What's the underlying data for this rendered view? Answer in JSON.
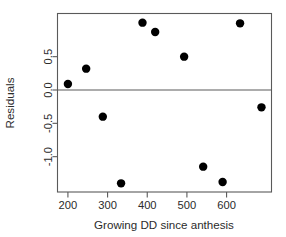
{
  "chart_data": {
    "type": "scatter",
    "title": "",
    "xlabel": "Growing DD since anthesis",
    "ylabel": "Residuals",
    "xlim": [
      175,
      712
    ],
    "ylim": [
      -1.53,
      1.14
    ],
    "grid": false,
    "legend": null,
    "xticks": [
      200,
      300,
      400,
      500,
      600
    ],
    "xtick_labels": [
      "200",
      "300",
      "400",
      "500",
      "600"
    ],
    "yticks": [
      0.5,
      0.0,
      -0.5,
      -1.0
    ],
    "ytick_labels": [
      "0.5",
      "0.0",
      "-0.5",
      "-1.0"
    ],
    "reference_lines": [
      {
        "orientation": "horizontal",
        "value": 0.0
      }
    ],
    "marker": {
      "shape": "circle",
      "color": "#000000",
      "size": 4.2
    },
    "x": [
      200,
      246,
      288,
      334,
      388,
      420,
      493,
      541,
      590,
      634,
      688
    ],
    "y": [
      0.09,
      0.32,
      -0.4,
      -1.4,
      1.01,
      0.87,
      0.5,
      -1.15,
      -1.38,
      1.0,
      -0.26
    ],
    "points": [
      {
        "x": 200,
        "y": 0.09
      },
      {
        "x": 246,
        "y": 0.32
      },
      {
        "x": 288,
        "y": -0.4
      },
      {
        "x": 334,
        "y": -1.4
      },
      {
        "x": 388,
        "y": 1.01
      },
      {
        "x": 420,
        "y": 0.87
      },
      {
        "x": 493,
        "y": 0.5
      },
      {
        "x": 541,
        "y": -1.15
      },
      {
        "x": 590,
        "y": -1.38
      },
      {
        "x": 634,
        "y": 1.0
      },
      {
        "x": 688,
        "y": -0.26
      }
    ]
  },
  "axes": {
    "x_title": "Growing DD since anthesis",
    "y_title": "Residuals"
  },
  "colors": {
    "point": "#000000",
    "axis": "#5a5a5a",
    "text": "#2b2b2b",
    "background": "#ffffff"
  }
}
